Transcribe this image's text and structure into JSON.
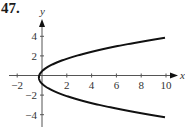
{
  "problem_number": "47.",
  "chart_data": {
    "type": "line",
    "title": "",
    "xlabel": "x",
    "ylabel": "y",
    "xlim": [
      -2.5,
      10.8
    ],
    "ylim": [
      -5,
      5.5
    ],
    "x_ticks": [
      -2,
      2,
      4,
      6,
      8,
      10
    ],
    "y_ticks": [
      4,
      2,
      -2,
      -4
    ],
    "x_tick_labels": [
      "−2",
      "2",
      "4",
      "6",
      "8",
      "10"
    ],
    "y_tick_labels": [
      "4",
      "2",
      "−2",
      "−4"
    ],
    "grid": false,
    "legend": null,
    "series": [
      {
        "name": "curve",
        "description": "Sideways parabola opening right, vertex near (-0.25, -0.2)",
        "points": [
          {
            "x": 9.9,
            "y": 3.85
          },
          {
            "x": 6.0,
            "y": 3.0
          },
          {
            "x": 4.0,
            "y": 2.1
          },
          {
            "x": 2.0,
            "y": 1.4
          },
          {
            "x": 0.0,
            "y": 0.45
          },
          {
            "x": -0.25,
            "y": -0.2
          },
          {
            "x": 0.0,
            "y": -0.85
          },
          {
            "x": 2.0,
            "y": -2.0
          },
          {
            "x": 4.0,
            "y": -2.7
          },
          {
            "x": 6.0,
            "y": -3.4
          },
          {
            "x": 9.9,
            "y": -4.25
          }
        ]
      }
    ]
  },
  "colors": {
    "axis": "#555555",
    "curve": "#111111"
  }
}
